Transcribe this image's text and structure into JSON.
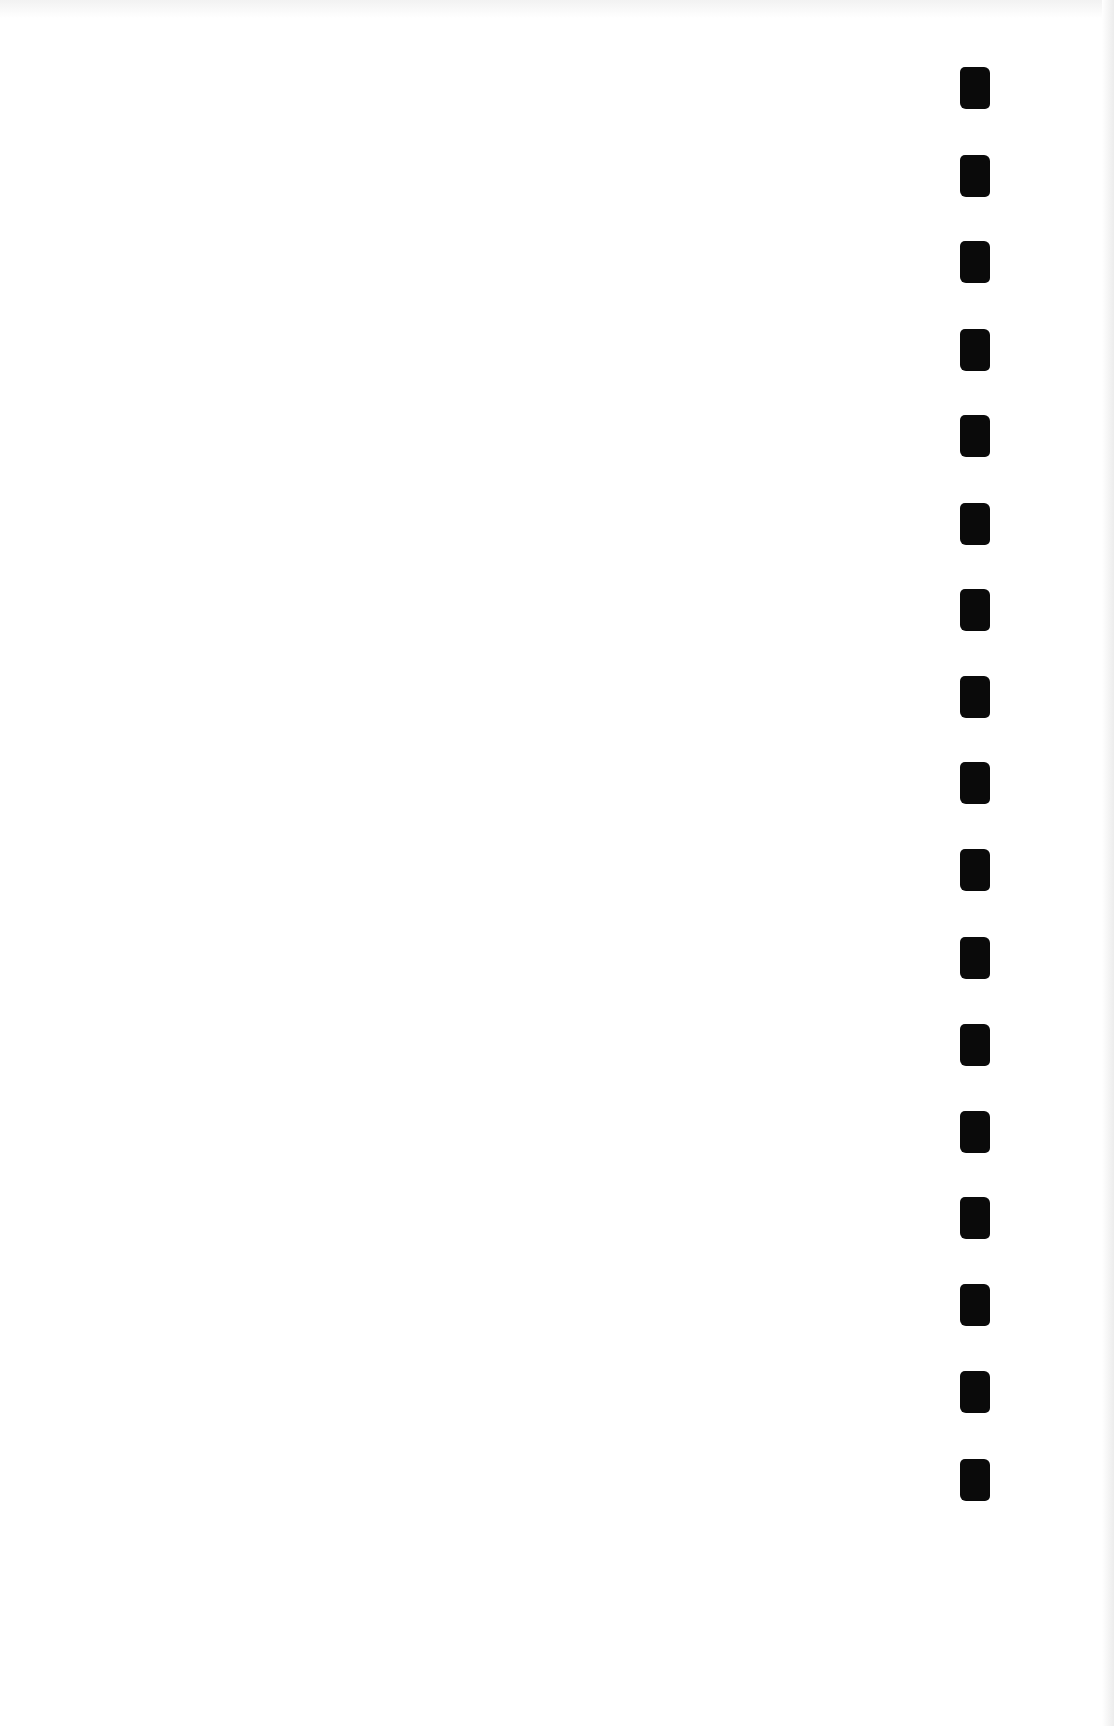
{
  "page": {
    "type": "blank scanned page",
    "background_color": "#ffffff",
    "content_text": ""
  },
  "binding_marks": {
    "color": "#0a0a0a",
    "count": 17,
    "x": 960,
    "width": 30,
    "height": 42,
    "y_positions": [
      67,
      155,
      241,
      329,
      415,
      503,
      589,
      676,
      762,
      849,
      937,
      1024,
      1111,
      1197,
      1284,
      1371,
      1459
    ]
  }
}
